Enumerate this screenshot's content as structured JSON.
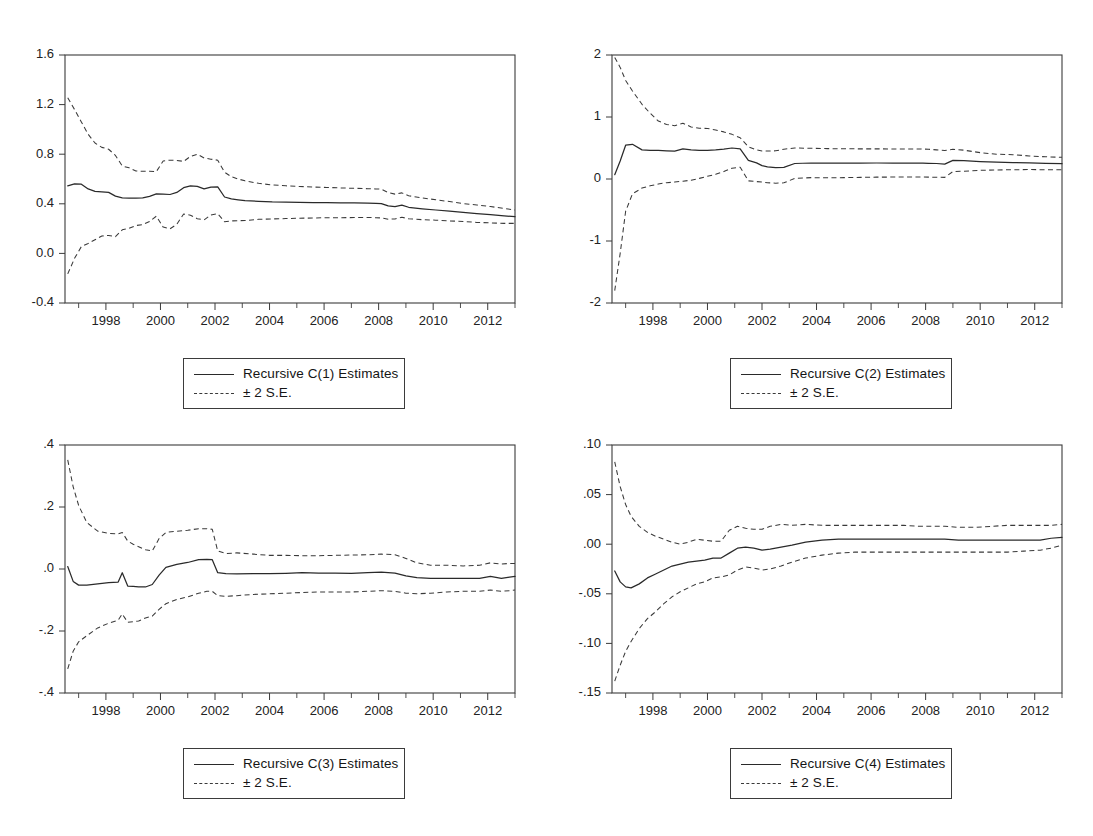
{
  "figure": {
    "kind": "recursive-coefficient-estimates",
    "panel_count": 4,
    "background": "#ffffff",
    "line_color": "#2a2a2a",
    "dash_color": "#3a3a3a",
    "frame_color": "#3b3b3b"
  },
  "legend_common": {
    "se_label": "± 2 S.E.",
    "solid_key": "solid-line-key",
    "dash_key": "dashed-line-key"
  },
  "chart_data": [
    {
      "id": "c1",
      "type": "line",
      "title": "",
      "xlabel": "",
      "ylabel": "",
      "xlim": [
        1996.5,
        2013.0
      ],
      "ylim": [
        -0.4,
        1.6
      ],
      "yticks": [
        -0.4,
        0.0,
        0.4,
        0.8,
        1.2,
        1.6
      ],
      "yticklabels": [
        "-0.4",
        "0.0",
        "0.4",
        "0.8",
        "1.2",
        "1.6"
      ],
      "xticks": [
        1998,
        2000,
        2002,
        2004,
        2006,
        2008,
        2010,
        2012
      ],
      "xticklabels": [
        "1998",
        "2000",
        "2002",
        "2004",
        "2006",
        "2008",
        "2010",
        "2012"
      ],
      "xminor": [
        1997,
        1999,
        2001,
        2003,
        2005,
        2007,
        2009,
        2011,
        2013
      ],
      "grid": false,
      "legend_position": "below-center",
      "legend": [
        "Recursive C(1) Estimates",
        "± 2 S.E."
      ],
      "x": [
        1996.6,
        1996.85,
        1997.1,
        1997.35,
        1997.6,
        1997.85,
        1998.1,
        1998.35,
        1998.6,
        1998.85,
        1999.1,
        1999.35,
        1999.6,
        1999.85,
        2000.1,
        2000.35,
        2000.6,
        2000.85,
        2001.1,
        2001.35,
        2001.6,
        2001.85,
        2002.1,
        2002.35,
        2002.6,
        2002.85,
        2003.1,
        2003.6,
        2004.1,
        2004.6,
        2005.1,
        2005.6,
        2006.1,
        2006.6,
        2007.1,
        2007.6,
        2007.9,
        2008.1,
        2008.35,
        2008.6,
        2008.85,
        2009.1,
        2009.6,
        2010.1,
        2010.6,
        2011.1,
        2011.6,
        2012.1,
        2012.6,
        2013.0
      ],
      "series": [
        {
          "name": "Recursive C(1) Estimates",
          "style": "solid",
          "values": [
            0.545,
            0.56,
            0.558,
            0.52,
            0.5,
            0.497,
            0.492,
            0.462,
            0.448,
            0.446,
            0.445,
            0.448,
            0.46,
            0.48,
            0.478,
            0.475,
            0.492,
            0.53,
            0.545,
            0.54,
            0.52,
            0.535,
            0.536,
            0.455,
            0.44,
            0.432,
            0.425,
            0.42,
            0.415,
            0.413,
            0.412,
            0.41,
            0.41,
            0.408,
            0.407,
            0.406,
            0.404,
            0.402,
            0.383,
            0.378,
            0.39,
            0.372,
            0.36,
            0.35,
            0.34,
            0.33,
            0.32,
            0.312,
            0.302,
            0.296
          ]
        },
        {
          "name": "Upper 2 S.E.",
          "style": "dashed",
          "values": [
            1.255,
            1.16,
            1.06,
            0.96,
            0.89,
            0.855,
            0.84,
            0.79,
            0.705,
            0.69,
            0.665,
            0.662,
            0.662,
            0.66,
            0.745,
            0.752,
            0.75,
            0.742,
            0.782,
            0.8,
            0.77,
            0.76,
            0.752,
            0.655,
            0.618,
            0.6,
            0.585,
            0.565,
            0.552,
            0.545,
            0.54,
            0.535,
            0.532,
            0.528,
            0.525,
            0.522,
            0.52,
            0.518,
            0.49,
            0.478,
            0.488,
            0.465,
            0.448,
            0.432,
            0.418,
            0.402,
            0.39,
            0.378,
            0.362,
            0.35
          ]
        },
        {
          "name": "Lower 2 S.E.",
          "style": "dashed",
          "values": [
            -0.165,
            -0.04,
            0.055,
            0.08,
            0.11,
            0.14,
            0.145,
            0.135,
            0.19,
            0.202,
            0.225,
            0.232,
            0.258,
            0.3,
            0.212,
            0.198,
            0.235,
            0.318,
            0.308,
            0.28,
            0.27,
            0.31,
            0.32,
            0.255,
            0.262,
            0.264,
            0.265,
            0.275,
            0.278,
            0.281,
            0.284,
            0.285,
            0.288,
            0.288,
            0.289,
            0.29,
            0.288,
            0.286,
            0.276,
            0.278,
            0.292,
            0.279,
            0.272,
            0.268,
            0.262,
            0.258,
            0.25,
            0.246,
            0.242,
            0.242
          ]
        }
      ]
    },
    {
      "id": "c2",
      "type": "line",
      "title": "",
      "xlabel": "",
      "ylabel": "",
      "xlim": [
        1996.5,
        2013.0
      ],
      "ylim": [
        -2,
        2
      ],
      "yticks": [
        -2,
        -1,
        0,
        1,
        2
      ],
      "yticklabels": [
        "-2",
        "-1",
        "0",
        "1",
        "2"
      ],
      "xticks": [
        1998,
        2000,
        2002,
        2004,
        2006,
        2008,
        2010,
        2012
      ],
      "xticklabels": [
        "1998",
        "2000",
        "2002",
        "2004",
        "2006",
        "2008",
        "2010",
        "2012"
      ],
      "xminor": [
        1997,
        1999,
        2001,
        2003,
        2005,
        2007,
        2009,
        2011,
        2013
      ],
      "grid": false,
      "legend_position": "below-center",
      "legend": [
        "Recursive C(2) Estimates",
        "± 2 S.E."
      ],
      "x": [
        1996.6,
        1996.8,
        1997.0,
        1997.25,
        1997.6,
        1997.9,
        1998.2,
        1998.5,
        1998.8,
        1999.1,
        1999.4,
        1999.7,
        2000.0,
        2000.3,
        2000.6,
        2000.9,
        2001.2,
        2001.5,
        2001.8,
        2002.0,
        2002.2,
        2002.5,
        2002.8,
        2003.2,
        2003.8,
        2004.4,
        2005.0,
        2005.6,
        2006.2,
        2006.8,
        2007.4,
        2007.9,
        2008.1,
        2008.4,
        2008.7,
        2009.0,
        2009.4,
        2010.0,
        2010.6,
        2011.2,
        2011.8,
        2012.4,
        2013.0
      ],
      "series": [
        {
          "name": "Recursive C(2) Estimates",
          "style": "solid",
          "values": [
            0.07,
            0.29,
            0.545,
            0.56,
            0.47,
            0.462,
            0.46,
            0.455,
            0.45,
            0.485,
            0.468,
            0.462,
            0.462,
            0.468,
            0.48,
            0.5,
            0.486,
            0.3,
            0.26,
            0.215,
            0.195,
            0.185,
            0.188,
            0.25,
            0.258,
            0.255,
            0.255,
            0.256,
            0.258,
            0.256,
            0.255,
            0.255,
            0.253,
            0.25,
            0.24,
            0.3,
            0.295,
            0.282,
            0.272,
            0.265,
            0.26,
            0.252,
            0.248
          ]
        },
        {
          "name": "Upper 2 S.E.",
          "style": "dashed",
          "values": [
            1.96,
            1.8,
            1.59,
            1.42,
            1.205,
            1.06,
            0.935,
            0.88,
            0.86,
            0.9,
            0.84,
            0.82,
            0.815,
            0.79,
            0.76,
            0.72,
            0.665,
            0.52,
            0.47,
            0.452,
            0.45,
            0.455,
            0.48,
            0.5,
            0.495,
            0.49,
            0.488,
            0.486,
            0.486,
            0.485,
            0.484,
            0.483,
            0.48,
            0.47,
            0.46,
            0.48,
            0.465,
            0.425,
            0.4,
            0.392,
            0.372,
            0.358,
            0.35
          ]
        },
        {
          "name": "Lower 2 S.E.",
          "style": "dashed",
          "values": [
            -1.8,
            -1.2,
            -0.52,
            -0.24,
            -0.145,
            -0.11,
            -0.08,
            -0.06,
            -0.05,
            -0.035,
            -0.02,
            0.01,
            0.045,
            0.075,
            0.12,
            0.175,
            0.19,
            -0.03,
            -0.042,
            -0.048,
            -0.06,
            -0.068,
            -0.062,
            0.01,
            0.022,
            0.02,
            0.022,
            0.026,
            0.03,
            0.031,
            0.032,
            0.032,
            0.03,
            0.028,
            0.026,
            0.12,
            0.125,
            0.14,
            0.145,
            0.15,
            0.152,
            0.15,
            0.15
          ]
        }
      ]
    },
    {
      "id": "c3",
      "type": "line",
      "title": "",
      "xlabel": "",
      "ylabel": "",
      "xlim": [
        1996.5,
        2013.0
      ],
      "ylim": [
        -0.4,
        0.4
      ],
      "yticks": [
        -0.4,
        -0.2,
        0.0,
        0.2,
        0.4
      ],
      "yticklabels": [
        "-.4",
        "-.2",
        ".0",
        ".2",
        ".4"
      ],
      "xticks": [
        1998,
        2000,
        2002,
        2004,
        2006,
        2008,
        2010,
        2012
      ],
      "xticklabels": [
        "1998",
        "2000",
        "2002",
        "2004",
        "2006",
        "2008",
        "2010",
        "2012"
      ],
      "xminor": [
        1997,
        1999,
        2001,
        2003,
        2005,
        2007,
        2009,
        2011,
        2013
      ],
      "grid": false,
      "legend_position": "below-center",
      "legend": [
        "Recursive C(3) Estimates",
        "± 2 S.E."
      ],
      "x": [
        1996.6,
        1996.8,
        1997.0,
        1997.3,
        1997.7,
        1998.1,
        1998.45,
        1998.6,
        1998.8,
        1999.0,
        1999.2,
        1999.45,
        1999.7,
        1999.95,
        2000.2,
        2000.6,
        2001.0,
        2001.4,
        2001.7,
        2001.9,
        2002.1,
        2002.4,
        2002.8,
        2003.4,
        2004.0,
        2004.6,
        2005.2,
        2005.8,
        2006.4,
        2007.0,
        2007.6,
        2008.1,
        2008.6,
        2009.0,
        2009.4,
        2009.9,
        2010.5,
        2011.1,
        2011.7,
        2012.1,
        2012.5,
        2012.8,
        2013.0
      ],
      "series": [
        {
          "name": "Recursive C(3) Estimates",
          "style": "solid",
          "values": [
            0.008,
            -0.04,
            -0.052,
            -0.052,
            -0.048,
            -0.044,
            -0.042,
            -0.012,
            -0.055,
            -0.056,
            -0.058,
            -0.058,
            -0.05,
            -0.02,
            0.005,
            0.015,
            0.021,
            0.03,
            0.031,
            0.03,
            -0.012,
            -0.015,
            -0.016,
            -0.015,
            -0.015,
            -0.014,
            -0.012,
            -0.013,
            -0.013,
            -0.014,
            -0.012,
            -0.01,
            -0.013,
            -0.022,
            -0.028,
            -0.03,
            -0.03,
            -0.03,
            -0.03,
            -0.024,
            -0.03,
            -0.026,
            -0.024
          ]
        },
        {
          "name": "Upper 2 S.E.",
          "style": "dashed",
          "values": [
            0.352,
            0.265,
            0.205,
            0.15,
            0.122,
            0.115,
            0.113,
            0.118,
            0.09,
            0.08,
            0.072,
            0.062,
            0.058,
            0.098,
            0.118,
            0.122,
            0.125,
            0.13,
            0.13,
            0.128,
            0.058,
            0.05,
            0.052,
            0.048,
            0.044,
            0.044,
            0.043,
            0.043,
            0.044,
            0.045,
            0.046,
            0.048,
            0.046,
            0.034,
            0.02,
            0.012,
            0.012,
            0.01,
            0.012,
            0.02,
            0.016,
            0.018,
            0.018
          ]
        },
        {
          "name": "Lower 2 S.E.",
          "style": "dashed",
          "values": [
            -0.322,
            -0.265,
            -0.235,
            -0.215,
            -0.19,
            -0.175,
            -0.165,
            -0.145,
            -0.172,
            -0.17,
            -0.168,
            -0.158,
            -0.152,
            -0.13,
            -0.112,
            -0.098,
            -0.09,
            -0.078,
            -0.072,
            -0.072,
            -0.086,
            -0.088,
            -0.086,
            -0.082,
            -0.08,
            -0.078,
            -0.076,
            -0.074,
            -0.074,
            -0.074,
            -0.072,
            -0.07,
            -0.072,
            -0.078,
            -0.08,
            -0.078,
            -0.074,
            -0.072,
            -0.072,
            -0.068,
            -0.072,
            -0.07,
            -0.068
          ]
        }
      ]
    },
    {
      "id": "c4",
      "type": "line",
      "title": "",
      "xlabel": "",
      "ylabel": "",
      "xlim": [
        1996.5,
        2013.0
      ],
      "ylim": [
        -0.15,
        0.1
      ],
      "yticks": [
        -0.15,
        -0.1,
        -0.05,
        0.0,
        0.05,
        0.1
      ],
      "yticklabels": [
        "-.15",
        "-.10",
        "-.05",
        ".00",
        ".05",
        ".10"
      ],
      "xticks": [
        1998,
        2000,
        2002,
        2004,
        2006,
        2008,
        2010,
        2012
      ],
      "xticklabels": [
        "1998",
        "2000",
        "2002",
        "2004",
        "2006",
        "2008",
        "2010",
        "2012"
      ],
      "xminor": [
        1997,
        1999,
        2001,
        2003,
        2005,
        2007,
        2009,
        2011,
        2013
      ],
      "grid": false,
      "legend_position": "below-center",
      "legend": [
        "Recursive C(4) Estimates",
        "± 2 S.E."
      ],
      "x": [
        1996.6,
        1996.8,
        1997.0,
        1997.2,
        1997.5,
        1997.8,
        1998.1,
        1998.4,
        1998.7,
        1999.0,
        1999.3,
        1999.6,
        1999.9,
        2000.2,
        2000.5,
        2000.8,
        2001.1,
        2001.4,
        2001.7,
        2002.0,
        2002.3,
        2002.7,
        2003.1,
        2003.6,
        2004.2,
        2004.8,
        2005.4,
        2006.0,
        2006.6,
        2007.2,
        2007.8,
        2008.2,
        2008.7,
        2009.2,
        2009.8,
        2010.4,
        2011.0,
        2011.6,
        2012.2,
        2012.6,
        2013.0
      ],
      "series": [
        {
          "name": "Recursive C(4) Estimates",
          "style": "solid",
          "values": [
            -0.027,
            -0.038,
            -0.043,
            -0.044,
            -0.04,
            -0.034,
            -0.03,
            -0.026,
            -0.022,
            -0.02,
            -0.018,
            -0.017,
            -0.016,
            -0.014,
            -0.014,
            -0.009,
            -0.004,
            -0.003,
            -0.004,
            -0.006,
            -0.005,
            -0.003,
            -0.001,
            0.002,
            0.004,
            0.005,
            0.005,
            0.005,
            0.005,
            0.005,
            0.005,
            0.005,
            0.005,
            0.004,
            0.004,
            0.004,
            0.004,
            0.004,
            0.004,
            0.006,
            0.007
          ]
        },
        {
          "name": "Upper 2 S.E.",
          "style": "dashed",
          "values": [
            0.083,
            0.058,
            0.04,
            0.028,
            0.018,
            0.012,
            0.008,
            0.005,
            0.002,
            0.0,
            0.002,
            0.005,
            0.004,
            0.003,
            0.003,
            0.014,
            0.018,
            0.016,
            0.015,
            0.015,
            0.018,
            0.02,
            0.019,
            0.02,
            0.019,
            0.019,
            0.019,
            0.019,
            0.019,
            0.019,
            0.018,
            0.018,
            0.018,
            0.017,
            0.017,
            0.018,
            0.019,
            0.019,
            0.019,
            0.019,
            0.02
          ]
        },
        {
          "name": "Lower 2 S.E.",
          "style": "dashed",
          "values": [
            -0.138,
            -0.122,
            -0.108,
            -0.098,
            -0.085,
            -0.075,
            -0.068,
            -0.06,
            -0.053,
            -0.048,
            -0.044,
            -0.04,
            -0.038,
            -0.034,
            -0.033,
            -0.031,
            -0.026,
            -0.023,
            -0.024,
            -0.026,
            -0.025,
            -0.022,
            -0.018,
            -0.014,
            -0.011,
            -0.009,
            -0.008,
            -0.008,
            -0.008,
            -0.008,
            -0.008,
            -0.008,
            -0.008,
            -0.008,
            -0.008,
            -0.008,
            -0.008,
            -0.007,
            -0.006,
            -0.004,
            -0.001
          ]
        }
      ]
    }
  ]
}
